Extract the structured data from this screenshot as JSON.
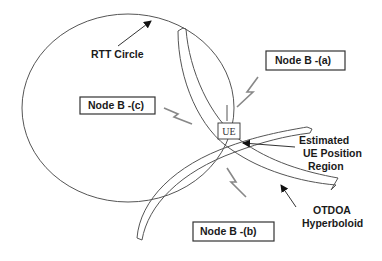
{
  "diagram": {
    "title": "",
    "labels": {
      "rtt_circle": "RTT Circle",
      "node_a": "Node B -(a)",
      "node_b": "Node B -(b)",
      "node_c": "Node B -(c)",
      "ue": "UE",
      "estimated_line1": "Estimated",
      "estimated_line2": "UE Position",
      "estimated_line3": "Region",
      "otdoa_line1": "OTDOA",
      "otdoa_line2": "Hyperboloid"
    },
    "colors": {
      "line": "#555555",
      "text": "#1a1a1a",
      "bolt": "#888888",
      "background": "#ffffff"
    }
  }
}
